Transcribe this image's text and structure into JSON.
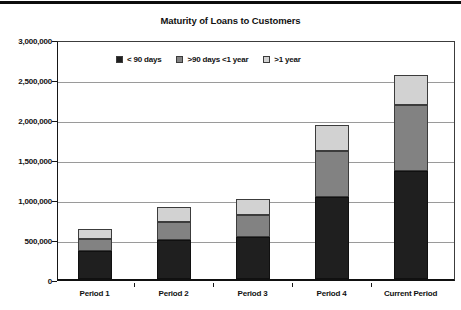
{
  "header": {
    "title": "Maturity of Loans to Customers"
  },
  "chart_data": {
    "type": "bar",
    "stacked": true,
    "title": "Maturity of Loans to Customers",
    "categories": [
      "Period 1",
      "Period 2",
      "Period 3",
      "Period 4",
      "Current Period"
    ],
    "series": [
      {
        "name": "< 90 days",
        "color": "#1f1f1f",
        "values": [
          350000,
          490000,
          520000,
          1025000,
          1350000
        ]
      },
      {
        "name": ">90 days <1 year",
        "color": "#828282",
        "values": [
          150000,
          220000,
          280000,
          575000,
          825000
        ]
      },
      {
        "name": ">1 year",
        "color": "#d2d2d2",
        "values": [
          130000,
          190000,
          200000,
          325000,
          375000
        ]
      }
    ],
    "totals": [
      630000,
      900000,
      1000000,
      1925000,
      2550000
    ],
    "xlabel": "",
    "ylabel": "",
    "ylim": [
      0,
      3000000
    ],
    "ytick_step": 500000,
    "ytick_labels": [
      "0",
      "500,000",
      "1,000,000",
      "1,500,000",
      "2,000,000",
      "2,500,000",
      "3,000,000"
    ],
    "grid": true,
    "legend_position": "top-inside"
  },
  "colors": {
    "background": "#ffffff",
    "gridline": "#9a9a9a",
    "axis": "#111111",
    "text": "#111111",
    "top_rule": "#0d0d0d"
  }
}
